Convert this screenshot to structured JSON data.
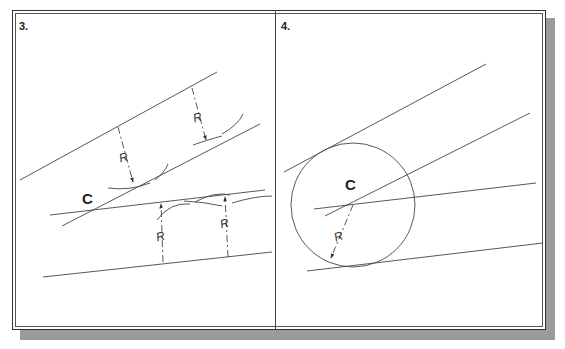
{
  "figure": {
    "panels": [
      {
        "label": "3.",
        "center_label": "C",
        "radius_label": "R"
      },
      {
        "label": "4.",
        "center_label": "C",
        "radius_label": "R"
      }
    ]
  },
  "colors": {
    "line": "#444444",
    "shadow": "#9a9a9a",
    "text": "#222222"
  }
}
